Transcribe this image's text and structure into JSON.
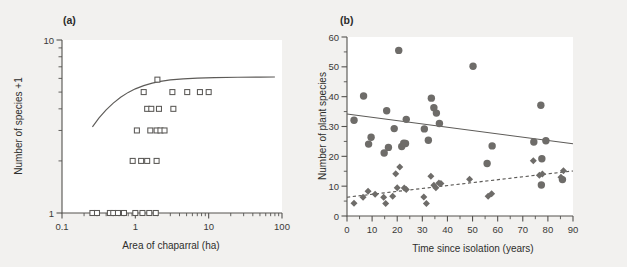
{
  "figure": {
    "background_color": "#f2f1ef",
    "plot_background_color": "#ffffff",
    "axis_color": "#54524f",
    "marker_fill_color": "#6e6c69",
    "open_marker_stroke_color": "#5a5855",
    "line_color": "#5d5b58"
  },
  "panels": {
    "a": {
      "label": "(a)",
      "xlabel": "Area of chaparral (ha)",
      "ylabel": "Number of species +1",
      "xticklabels": [
        "0.1",
        "1",
        "10",
        "100"
      ],
      "yticklabels": [
        "1",
        "10"
      ]
    },
    "b": {
      "label": "(b)",
      "xlabel": "Time since isolation (years)",
      "ylabel": "Number of plant species",
      "xticklabels": [
        "0",
        "10",
        "20",
        "30",
        "40",
        "50",
        "60",
        "70",
        "80",
        "90"
      ],
      "yticklabels": [
        "0",
        "10",
        "20",
        "30",
        "40",
        "50",
        "60"
      ]
    }
  },
  "chart_data": [
    {
      "id": "panel-a",
      "type": "scatter",
      "title": "(a)",
      "xlabel": "Area of chaparral (ha)",
      "ylabel": "Number of species +1",
      "xscale": "log",
      "yscale": "log",
      "xlim": [
        0.1,
        100
      ],
      "ylim": [
        1,
        10
      ],
      "xticks": [
        0.1,
        1,
        10,
        100
      ],
      "yticks": [
        1,
        10
      ],
      "grid": false,
      "legend": false,
      "marker_style": "open-square",
      "points": [
        {
          "x": 0.26,
          "y": 1.0
        },
        {
          "x": 0.3,
          "y": 1.0
        },
        {
          "x": 0.45,
          "y": 1.0
        },
        {
          "x": 0.5,
          "y": 1.0
        },
        {
          "x": 0.58,
          "y": 1.0
        },
        {
          "x": 0.7,
          "y": 1.0
        },
        {
          "x": 1.0,
          "y": 1.0
        },
        {
          "x": 1.25,
          "y": 1.0
        },
        {
          "x": 1.55,
          "y": 1.0
        },
        {
          "x": 1.9,
          "y": 1.0
        },
        {
          "x": 0.92,
          "y": 2.0
        },
        {
          "x": 1.2,
          "y": 2.0
        },
        {
          "x": 1.45,
          "y": 2.0
        },
        {
          "x": 1.95,
          "y": 2.0
        },
        {
          "x": 1.05,
          "y": 3.0
        },
        {
          "x": 1.6,
          "y": 3.0
        },
        {
          "x": 1.95,
          "y": 3.0
        },
        {
          "x": 2.2,
          "y": 3.0
        },
        {
          "x": 2.5,
          "y": 3.0
        },
        {
          "x": 1.45,
          "y": 4.0
        },
        {
          "x": 1.65,
          "y": 4.0
        },
        {
          "x": 2.1,
          "y": 4.0
        },
        {
          "x": 3.3,
          "y": 4.0
        },
        {
          "x": 1.3,
          "y": 5.0
        },
        {
          "x": 3.2,
          "y": 5.0
        },
        {
          "x": 5.1,
          "y": 5.0
        },
        {
          "x": 7.6,
          "y": 5.0
        },
        {
          "x": 10.0,
          "y": 5.0
        },
        {
          "x": 2.0,
          "y": 5.9
        }
      ],
      "fit_curve": {
        "style": "solid",
        "description": "saturating species-area curve",
        "points": [
          {
            "x": 0.26,
            "y": 3.15
          },
          {
            "x": 0.32,
            "y": 3.55
          },
          {
            "x": 0.4,
            "y": 3.95
          },
          {
            "x": 0.5,
            "y": 4.32
          },
          {
            "x": 0.63,
            "y": 4.67
          },
          {
            "x": 0.8,
            "y": 4.98
          },
          {
            "x": 1.0,
            "y": 5.22
          },
          {
            "x": 1.3,
            "y": 5.45
          },
          {
            "x": 1.7,
            "y": 5.63
          },
          {
            "x": 2.2,
            "y": 5.77
          },
          {
            "x": 3.0,
            "y": 5.88
          },
          {
            "x": 4.5,
            "y": 5.96
          },
          {
            "x": 7.0,
            "y": 6.02
          },
          {
            "x": 12.0,
            "y": 6.06
          },
          {
            "x": 25.0,
            "y": 6.09
          },
          {
            "x": 50.0,
            "y": 6.1
          },
          {
            "x": 80.0,
            "y": 6.11
          }
        ]
      }
    },
    {
      "id": "panel-b",
      "type": "scatter",
      "title": "(b)",
      "xlabel": "Time since isolation (years)",
      "ylabel": "Number of plant species",
      "xscale": "linear",
      "yscale": "linear",
      "xlim": [
        0,
        90
      ],
      "ylim": [
        0,
        60
      ],
      "xticks": [
        0,
        10,
        20,
        30,
        40,
        50,
        60,
        70,
        80,
        90
      ],
      "yticks": [
        0,
        10,
        20,
        30,
        40,
        50,
        60
      ],
      "grid": false,
      "legend": false,
      "series": [
        {
          "name": "native species",
          "marker_style": "filled-circle",
          "trend_style": "solid",
          "trend": {
            "x0": 0,
            "y0": 34.2,
            "x1": 90,
            "y1": 24.2
          },
          "points": [
            {
              "x": 2.8,
              "y": 32.1
            },
            {
              "x": 6.6,
              "y": 40.2
            },
            {
              "x": 8.6,
              "y": 24.1
            },
            {
              "x": 9.6,
              "y": 26.4
            },
            {
              "x": 14.8,
              "y": 21.1
            },
            {
              "x": 15.8,
              "y": 35.3
            },
            {
              "x": 16.5,
              "y": 23.0
            },
            {
              "x": 18.8,
              "y": 29.3
            },
            {
              "x": 20.6,
              "y": 55.5
            },
            {
              "x": 21.8,
              "y": 23.3
            },
            {
              "x": 22.6,
              "y": 24.4
            },
            {
              "x": 23.3,
              "y": 24.3
            },
            {
              "x": 23.6,
              "y": 32.4
            },
            {
              "x": 30.8,
              "y": 29.2
            },
            {
              "x": 32.4,
              "y": 25.4
            },
            {
              "x": 33.6,
              "y": 39.5
            },
            {
              "x": 34.6,
              "y": 36.3
            },
            {
              "x": 35.6,
              "y": 34.5
            },
            {
              "x": 36.8,
              "y": 31.0
            },
            {
              "x": 50.2,
              "y": 50.2
            },
            {
              "x": 55.8,
              "y": 17.6
            },
            {
              "x": 57.8,
              "y": 23.5
            },
            {
              "x": 74.4,
              "y": 24.8
            },
            {
              "x": 77.2,
              "y": 37.1
            },
            {
              "x": 77.6,
              "y": 19.2
            },
            {
              "x": 77.4,
              "y": 10.4
            },
            {
              "x": 79.2,
              "y": 25.2
            },
            {
              "x": 85.8,
              "y": 12.2
            }
          ]
        },
        {
          "name": "exotic species",
          "marker_style": "filled-diamond",
          "trend_style": "dashed",
          "trend": {
            "x0": 0,
            "y0": 6.3,
            "x1": 90,
            "y1": 15.1
          },
          "points": [
            {
              "x": 2.8,
              "y": 4.3
            },
            {
              "x": 6.4,
              "y": 6.3
            },
            {
              "x": 8.4,
              "y": 8.3
            },
            {
              "x": 11.2,
              "y": 7.3
            },
            {
              "x": 14.6,
              "y": 6.3
            },
            {
              "x": 15.4,
              "y": 4.2
            },
            {
              "x": 18.2,
              "y": 6.6
            },
            {
              "x": 19.4,
              "y": 14.2
            },
            {
              "x": 20.0,
              "y": 9.5
            },
            {
              "x": 21.0,
              "y": 16.4
            },
            {
              "x": 22.8,
              "y": 9.4
            },
            {
              "x": 23.6,
              "y": 8.9
            },
            {
              "x": 30.6,
              "y": 6.4
            },
            {
              "x": 31.6,
              "y": 4.2
            },
            {
              "x": 33.4,
              "y": 13.3
            },
            {
              "x": 34.6,
              "y": 10.3
            },
            {
              "x": 35.4,
              "y": 9.5
            },
            {
              "x": 36.6,
              "y": 11.1
            },
            {
              "x": 37.4,
              "y": 10.9
            },
            {
              "x": 48.8,
              "y": 12.3
            },
            {
              "x": 56.2,
              "y": 6.6
            },
            {
              "x": 57.6,
              "y": 7.5
            },
            {
              "x": 74.2,
              "y": 18.5
            },
            {
              "x": 76.6,
              "y": 13.7
            },
            {
              "x": 77.8,
              "y": 14.1
            },
            {
              "x": 85.2,
              "y": 13.0
            },
            {
              "x": 86.2,
              "y": 15.2
            }
          ]
        }
      ]
    }
  ]
}
